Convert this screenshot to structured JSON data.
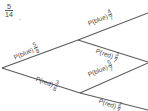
{
  "diagram": {
    "type": "probability-tree",
    "corner_annotation": {
      "numerator": "5",
      "denominator": "14",
      "trailing_mark": "."
    },
    "branches": [
      {
        "id": "level1-blue",
        "label": "P(blue)",
        "numerator": "5",
        "denominator": "8"
      },
      {
        "id": "level1-red",
        "label": "P(red)",
        "numerator": "3",
        "denominator": "8"
      },
      {
        "id": "level2-upper-blue",
        "label": "P(blue)",
        "numerator": "4",
        "denominator": "7"
      },
      {
        "id": "level2-upper-red",
        "label": "P(red)",
        "numerator": "3",
        "denominator": "7"
      },
      {
        "id": "level2-lower-blue",
        "label": "P(blue)",
        "numerator": "5",
        "denominator": "7"
      },
      {
        "id": "level2-lower-red",
        "label": "P(red)",
        "numerator": "2",
        "denominator": "7"
      }
    ],
    "colors": {
      "line": "#5a5a5a",
      "text": "#4a4a4a",
      "background": "#ffffff"
    }
  }
}
